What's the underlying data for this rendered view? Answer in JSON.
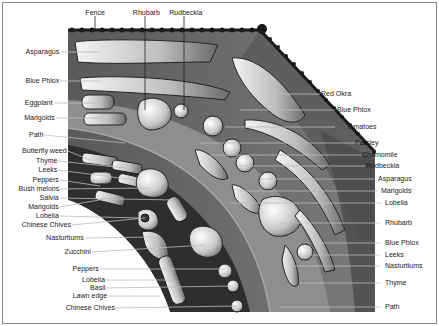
{
  "diagram": {
    "type": "garden-plan",
    "colors": {
      "bed_dark": "#3a3a3a",
      "bed_mid": "#6e6e6e",
      "path": "#8c8c8c",
      "lawn": "#ffffff",
      "fence": "#1a1a1a"
    }
  },
  "labels": {
    "top": [
      {
        "text": "Fence",
        "x": 95,
        "y": 12
      },
      {
        "text": "Rhubarb",
        "x": 145,
        "y": 12
      },
      {
        "text": "Rudbeckia",
        "x": 184,
        "y": 12
      }
    ],
    "left": [
      {
        "text": "Asparagus",
        "y": 52
      },
      {
        "text": "Blue Phlox",
        "y": 81
      },
      {
        "text": "Eggplant",
        "y": 103
      },
      {
        "text": "Marigolds",
        "y": 118
      },
      {
        "text": "Path",
        "y": 135
      },
      {
        "text": "Butterfly weed",
        "y": 151
      },
      {
        "text": "Thyme",
        "y": 161
      },
      {
        "text": "Leeks",
        "y": 170
      },
      {
        "text": "Peppers",
        "y": 180
      },
      {
        "text": "Bush melons",
        "y": 189
      },
      {
        "text": "Salvia",
        "y": 198
      },
      {
        "text": "Marigolds",
        "y": 207
      },
      {
        "text": "Lobelia",
        "y": 216
      },
      {
        "text": "Chinese Chives",
        "y": 225
      },
      {
        "text": "Nasturtiums",
        "y": 238
      },
      {
        "text": "Zucchini",
        "y": 252
      },
      {
        "text": "Peppers",
        "y": 269
      },
      {
        "text": "Lobelia",
        "y": 280
      },
      {
        "text": "Basil",
        "y": 288
      },
      {
        "text": "Lawn edge",
        "y": 296
      },
      {
        "text": "Chinese Chives",
        "y": 308
      }
    ],
    "right": [
      {
        "text": "Red Okra",
        "y": 94
      },
      {
        "text": "Blue Phlox",
        "y": 110
      },
      {
        "text": "Tomatoes",
        "y": 127
      },
      {
        "text": "Parsley",
        "y": 143
      },
      {
        "text": "Chamomile",
        "y": 155
      },
      {
        "text": "Rudbeckia",
        "y": 166
      },
      {
        "text": "Asparagus",
        "y": 179
      },
      {
        "text": "Marigolds",
        "y": 191
      },
      {
        "text": "Lobelia",
        "y": 203
      },
      {
        "text": "Rhubarb",
        "y": 223
      },
      {
        "text": "Blue Phlox",
        "y": 243
      },
      {
        "text": "Leeks",
        "y": 255
      },
      {
        "text": "Nasturtiums",
        "y": 266
      },
      {
        "text": "Thyme",
        "y": 283
      },
      {
        "text": "Path",
        "y": 307
      }
    ]
  }
}
